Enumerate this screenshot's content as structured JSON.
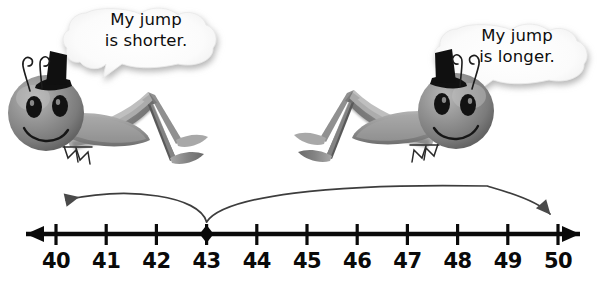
{
  "scene": {
    "title": "Grasshopper jumps on a number line",
    "background_color": "#ffffff",
    "ink_color": "#0a0a0a",
    "body_color": "#8a8a8a"
  },
  "characters": [
    {
      "id": "left-grasshopper",
      "name": "left-grasshopper",
      "facing": "right",
      "speech": "My jump\nis shorter.",
      "speech_line1": "My jump",
      "speech_line2": "is shorter."
    },
    {
      "id": "right-grasshopper",
      "name": "right-grasshopper",
      "facing": "left",
      "speech": "My jump\nis longer.",
      "speech_line1": "My jump",
      "speech_line2": "is longer."
    }
  ],
  "number_line": {
    "min": 40,
    "max": 50,
    "step": 1,
    "labels": [
      "40",
      "41",
      "42",
      "43",
      "44",
      "45",
      "46",
      "47",
      "48",
      "49",
      "50"
    ],
    "values": [
      40,
      41,
      42,
      43,
      44,
      45,
      46,
      47,
      48,
      49,
      50
    ],
    "marker_value": 43,
    "marker_shape": "diamond",
    "left_arrow": true,
    "right_arrow": true
  },
  "jumps": [
    {
      "id": "short-jump",
      "name": "short-jump-arc",
      "from": 43,
      "to": 40,
      "length": 3,
      "direction": "left",
      "label": "My jump is shorter."
    },
    {
      "id": "long-jump",
      "name": "long-jump-arc",
      "from": 43,
      "to": 50,
      "length": 7,
      "direction": "right",
      "label": "My jump is longer."
    }
  ]
}
